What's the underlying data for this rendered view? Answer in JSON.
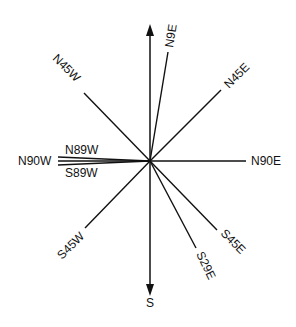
{
  "diagram": {
    "colors": {
      "line": "#111111",
      "background": "#ffffff"
    },
    "center": {
      "x": 150,
      "y": 161
    },
    "arrows": [
      {
        "id": "north",
        "label": "",
        "x2": 150,
        "y2": 26
      },
      {
        "id": "south",
        "label": "S",
        "x2": 150,
        "y2": 294
      }
    ],
    "bearings": [
      {
        "id": "n9e",
        "label": "N9E",
        "x2": 168,
        "y2": 52
      },
      {
        "id": "n45e",
        "label": "N45E",
        "x2": 221,
        "y2": 90
      },
      {
        "id": "n45w",
        "label": "N45W",
        "x2": 84,
        "y2": 93
      },
      {
        "id": "n90e",
        "label": "N90E",
        "x2": 246,
        "y2": 161
      },
      {
        "id": "n90w",
        "label": "N90W",
        "x2": 58,
        "y2": 161
      },
      {
        "id": "n89w",
        "label": "N89W",
        "x2": 58,
        "y2": 157
      },
      {
        "id": "s89w",
        "label": "S89W",
        "x2": 58,
        "y2": 165
      },
      {
        "id": "s45w",
        "label": "S45W",
        "x2": 85,
        "y2": 228
      },
      {
        "id": "s29e",
        "label": "S29E",
        "x2": 196,
        "y2": 248
      },
      {
        "id": "s45e",
        "label": "S45E",
        "x2": 217,
        "y2": 230
      }
    ]
  }
}
